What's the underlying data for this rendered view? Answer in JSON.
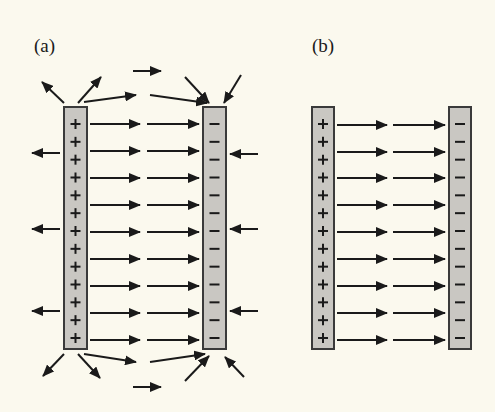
{
  "figure": {
    "background": "#fbf9ee",
    "plate_fill": "#c9c7c2",
    "plate_stroke": "#3a3a3a",
    "arrow_color": "#1a1a1a",
    "charge_color": "#1a1a1a"
  },
  "panels": [
    {
      "id": "a",
      "label": "(a)",
      "description": "Parallel-plate capacitor with fringing field",
      "positive_plate": {
        "x": 64,
        "y": 107,
        "width": 23,
        "height": 242,
        "charge_symbol": "+",
        "charge_count": 13
      },
      "negative_plate": {
        "x": 203,
        "y": 107,
        "width": 23,
        "height": 242,
        "charge_symbol": "−",
        "charge_count": 13
      },
      "interior_rows_y": [
        124,
        151,
        178,
        205,
        232,
        259,
        286,
        313,
        340
      ],
      "interior_segments": [
        {
          "x1": 90,
          "x2": 140
        },
        {
          "x1": 147,
          "x2": 199
        }
      ],
      "fringe_arrows": [
        {
          "x1": 64,
          "y1": 103,
          "x2": 42,
          "y2": 82
        },
        {
          "x1": 78,
          "y1": 103,
          "x2": 101,
          "y2": 77
        },
        {
          "x1": 84,
          "y1": 102,
          "x2": 136,
          "y2": 95
        },
        {
          "x1": 150,
          "y1": 95,
          "x2": 207,
          "y2": 103
        },
        {
          "x1": 133,
          "y1": 71,
          "x2": 161,
          "y2": 71
        },
        {
          "x1": 185,
          "y1": 77,
          "x2": 209,
          "y2": 103
        },
        {
          "x1": 241,
          "y1": 75,
          "x2": 224,
          "y2": 103
        },
        {
          "x1": 60,
          "y1": 153,
          "x2": 32,
          "y2": 153
        },
        {
          "x1": 60,
          "y1": 229,
          "x2": 32,
          "y2": 229
        },
        {
          "x1": 60,
          "y1": 311,
          "x2": 32,
          "y2": 311
        },
        {
          "x1": 258,
          "y1": 154,
          "x2": 230,
          "y2": 154
        },
        {
          "x1": 258,
          "y1": 229,
          "x2": 230,
          "y2": 229
        },
        {
          "x1": 258,
          "y1": 311,
          "x2": 230,
          "y2": 311
        },
        {
          "x1": 64,
          "y1": 354,
          "x2": 43,
          "y2": 376
        },
        {
          "x1": 78,
          "y1": 354,
          "x2": 100,
          "y2": 378
        },
        {
          "x1": 84,
          "y1": 354,
          "x2": 136,
          "y2": 362
        },
        {
          "x1": 150,
          "y1": 362,
          "x2": 205,
          "y2": 354
        },
        {
          "x1": 185,
          "y1": 381,
          "x2": 209,
          "y2": 356
        },
        {
          "x1": 244,
          "y1": 377,
          "x2": 225,
          "y2": 357
        },
        {
          "x1": 133,
          "y1": 387,
          "x2": 161,
          "y2": 387
        }
      ]
    },
    {
      "id": "b",
      "label": "(b)",
      "description": "Idealized uniform field between plates",
      "positive_plate": {
        "x": 312,
        "y": 107,
        "width": 22,
        "height": 242,
        "charge_symbol": "+",
        "charge_count": 13
      },
      "negative_plate": {
        "x": 449,
        "y": 107,
        "width": 22,
        "height": 242,
        "charge_symbol": "−",
        "charge_count": 13
      },
      "interior_rows_y": [
        125,
        152,
        178,
        205,
        232,
        259,
        286,
        313,
        340
      ],
      "interior_segments": [
        {
          "x1": 337,
          "x2": 387
        },
        {
          "x1": 393,
          "x2": 445
        }
      ],
      "fringe_arrows": []
    }
  ]
}
